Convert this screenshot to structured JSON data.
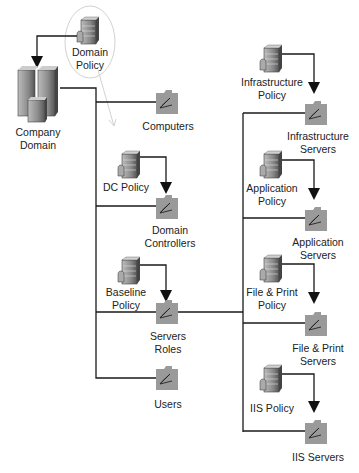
{
  "diagram": {
    "type": "group-policy-ou-hierarchy",
    "colors": {
      "line": "#1a1a1a",
      "folder": "#9a9a9a",
      "server": "#8c8c8c",
      "pencil": "#cfcfcf"
    },
    "root": {
      "label": "Company\nDomain",
      "icon": "server-cluster-icon",
      "policy": {
        "label": "Domain\nPolicy",
        "icon": "policy-server-icon"
      }
    },
    "ous": [
      {
        "label": "Computers",
        "icon": "ou-folder-icon"
      },
      {
        "label": "Domain\nControllers",
        "icon": "ou-folder-icon",
        "policy": {
          "label": "DC Policy",
          "icon": "policy-server-icon"
        }
      },
      {
        "label": "Servers\nRoles",
        "icon": "ou-folder-icon",
        "policy": {
          "label": "Baseline\nPolicy",
          "icon": "policy-server-icon"
        }
      },
      {
        "label": "Users",
        "icon": "ou-folder-icon"
      }
    ],
    "server_roles": [
      {
        "label": "Infrastructure\nServers",
        "policy": {
          "label": "Infrastructure\nPolicy"
        }
      },
      {
        "label": "Application\nServers",
        "policy": {
          "label": "Application\nPolicy"
        }
      },
      {
        "label": "File & Print\nServers",
        "policy": {
          "label": "File & Print\nPolicy"
        }
      },
      {
        "label": "IIS Servers",
        "policy": {
          "label": "IIS Policy"
        }
      }
    ]
  }
}
